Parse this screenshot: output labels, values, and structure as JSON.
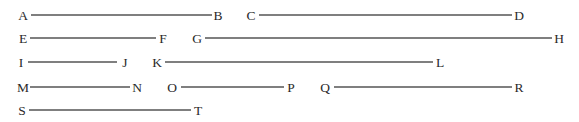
{
  "diagram": {
    "title": "",
    "line_color": "#555555",
    "label_color": "#2a2a2a",
    "segments": [
      {
        "id": "AB",
        "start": {
          "label": "A",
          "x": 23,
          "line_x": 31
        },
        "end": {
          "label": "B",
          "x": 218,
          "line_x": 212
        },
        "y": 15
      },
      {
        "id": "CD",
        "start": {
          "label": "C",
          "x": 251,
          "line_x": 259
        },
        "end": {
          "label": "D",
          "x": 519,
          "line_x": 512
        },
        "y": 15
      },
      {
        "id": "EF",
        "start": {
          "label": "E",
          "x": 23,
          "line_x": 30
        },
        "end": {
          "label": "F",
          "x": 163,
          "line_x": 156
        },
        "y": 38
      },
      {
        "id": "GH",
        "start": {
          "label": "G",
          "x": 197,
          "line_x": 205
        },
        "end": {
          "label": "H",
          "x": 559,
          "line_x": 552
        },
        "y": 38
      },
      {
        "id": "IJ",
        "start": {
          "label": "I",
          "x": 21,
          "line_x": 28
        },
        "end": {
          "label": "J",
          "x": 125,
          "line_x": 117
        },
        "y": 62
      },
      {
        "id": "KL",
        "start": {
          "label": "K",
          "x": 157,
          "line_x": 165
        },
        "end": {
          "label": "L",
          "x": 440,
          "line_x": 433
        },
        "y": 62
      },
      {
        "id": "MN",
        "start": {
          "label": "M",
          "x": 23,
          "line_x": 30
        },
        "end": {
          "label": "N",
          "x": 137,
          "line_x": 130
        },
        "y": 87
      },
      {
        "id": "OP",
        "start": {
          "label": "O",
          "x": 172,
          "line_x": 181
        },
        "end": {
          "label": "P",
          "x": 291,
          "line_x": 284
        },
        "y": 87
      },
      {
        "id": "QR",
        "start": {
          "label": "Q",
          "x": 325,
          "line_x": 334
        },
        "end": {
          "label": "R",
          "x": 519,
          "line_x": 512
        },
        "y": 87
      },
      {
        "id": "ST",
        "start": {
          "label": "S",
          "x": 22,
          "line_x": 29
        },
        "end": {
          "label": "T",
          "x": 198,
          "line_x": 191
        },
        "y": 110
      }
    ]
  }
}
